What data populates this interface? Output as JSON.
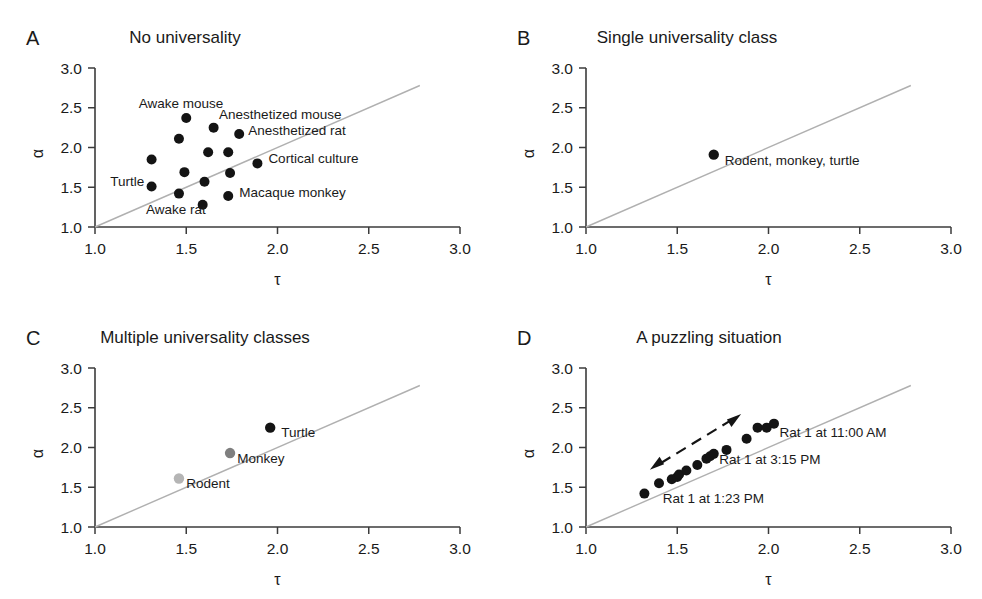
{
  "figure": {
    "axis_x_label": "τ",
    "axis_y_label": "α",
    "tick_labels": [
      "1.0",
      "1.5",
      "2.0",
      "2.5",
      "3.0"
    ],
    "tick_values": [
      1.0,
      1.5,
      2.0,
      2.5,
      3.0
    ],
    "axis_color": "#3b3b3b",
    "diagonal_color": "#b0b0b0",
    "point_color": "#141414"
  },
  "chart_data": [
    {
      "type": "scatter",
      "panel": "A",
      "title": "No universality",
      "xlabel": "τ",
      "ylabel": "α",
      "xlim": [
        1.0,
        3.0
      ],
      "ylim": [
        1.0,
        3.0
      ],
      "grid": false,
      "legend": "none",
      "identity_line": true,
      "points": [
        {
          "x": 1.5,
          "y": 2.37,
          "color": "#141414"
        },
        {
          "x": 1.65,
          "y": 2.25,
          "color": "#141414"
        },
        {
          "x": 1.46,
          "y": 2.11,
          "color": "#141414"
        },
        {
          "x": 1.79,
          "y": 2.17,
          "color": "#141414"
        },
        {
          "x": 1.31,
          "y": 1.85,
          "color": "#141414"
        },
        {
          "x": 1.62,
          "y": 1.94,
          "color": "#141414"
        },
        {
          "x": 1.73,
          "y": 1.94,
          "color": "#141414"
        },
        {
          "x": 1.89,
          "y": 1.8,
          "color": "#141414"
        },
        {
          "x": 1.49,
          "y": 1.69,
          "color": "#141414"
        },
        {
          "x": 1.74,
          "y": 1.68,
          "color": "#141414"
        },
        {
          "x": 1.31,
          "y": 1.51,
          "color": "#141414"
        },
        {
          "x": 1.6,
          "y": 1.57,
          "color": "#141414"
        },
        {
          "x": 1.46,
          "y": 1.42,
          "color": "#141414"
        },
        {
          "x": 1.73,
          "y": 1.39,
          "color": "#141414"
        },
        {
          "x": 1.59,
          "y": 1.28,
          "color": "#141414"
        }
      ],
      "annotations": [
        {
          "text": "Awake mouse",
          "x": 1.24,
          "y": 2.5,
          "anchor": "start"
        },
        {
          "text": "Anesthetized mouse",
          "x": 1.68,
          "y": 2.36,
          "anchor": "start"
        },
        {
          "text": "Anesthetized rat",
          "x": 1.84,
          "y": 2.16,
          "anchor": "start"
        },
        {
          "text": "Cortical culture",
          "x": 1.95,
          "y": 1.81,
          "anchor": "start"
        },
        {
          "text": "Turtle",
          "x": 1.27,
          "y": 1.51,
          "anchor": "end"
        },
        {
          "text": "Macaque monkey",
          "x": 1.79,
          "y": 1.38,
          "anchor": "start"
        },
        {
          "text": "Awake rat",
          "x": 1.28,
          "y": 1.16,
          "anchor": "start"
        }
      ]
    },
    {
      "type": "scatter",
      "panel": "B",
      "title": "Single universality class",
      "xlabel": "τ",
      "ylabel": "α",
      "xlim": [
        1.0,
        3.0
      ],
      "ylim": [
        1.0,
        3.0
      ],
      "grid": false,
      "legend": "none",
      "identity_line": true,
      "points": [
        {
          "x": 1.7,
          "y": 1.91,
          "color": "#141414"
        }
      ],
      "annotations": [
        {
          "text": "Rodent, monkey, turtle",
          "x": 1.76,
          "y": 1.78,
          "anchor": "start"
        }
      ]
    },
    {
      "type": "scatter",
      "panel": "C",
      "title": "Multiple universality classes",
      "xlabel": "τ",
      "ylabel": "α",
      "xlim": [
        1.0,
        3.0
      ],
      "ylim": [
        1.0,
        3.0
      ],
      "grid": false,
      "legend": "none",
      "identity_line": true,
      "points": [
        {
          "x": 1.46,
          "y": 1.61,
          "color": "#b5b5b5",
          "label": "Rodent"
        },
        {
          "x": 1.74,
          "y": 1.93,
          "color": "#7f7f7f",
          "label": "Monkey"
        },
        {
          "x": 1.96,
          "y": 2.25,
          "color": "#141414",
          "label": "Turtle"
        }
      ],
      "annotations": [
        {
          "text": "Turtle",
          "x": 2.02,
          "y": 2.13,
          "anchor": "start"
        },
        {
          "text": "Monkey",
          "x": 1.78,
          "y": 1.81,
          "anchor": "start"
        },
        {
          "text": "Rodent",
          "x": 1.5,
          "y": 1.49,
          "anchor": "start"
        }
      ]
    },
    {
      "type": "scatter",
      "panel": "D",
      "title": "A puzzling situation",
      "xlabel": "τ",
      "ylabel": "α",
      "xlim": [
        1.0,
        3.0
      ],
      "ylim": [
        1.0,
        3.0
      ],
      "grid": false,
      "legend": "none",
      "identity_line": true,
      "points": [
        {
          "x": 1.32,
          "y": 1.42,
          "color": "#141414"
        },
        {
          "x": 1.4,
          "y": 1.55,
          "color": "#141414"
        },
        {
          "x": 1.47,
          "y": 1.6,
          "color": "#141414"
        },
        {
          "x": 1.5,
          "y": 1.63,
          "color": "#141414"
        },
        {
          "x": 1.51,
          "y": 1.66,
          "color": "#141414"
        },
        {
          "x": 1.55,
          "y": 1.71,
          "color": "#141414"
        },
        {
          "x": 1.61,
          "y": 1.78,
          "color": "#141414"
        },
        {
          "x": 1.66,
          "y": 1.86,
          "color": "#141414"
        },
        {
          "x": 1.68,
          "y": 1.89,
          "color": "#141414"
        },
        {
          "x": 1.7,
          "y": 1.92,
          "color": "#141414"
        },
        {
          "x": 1.77,
          "y": 1.97,
          "color": "#141414"
        },
        {
          "x": 1.88,
          "y": 2.11,
          "color": "#141414"
        },
        {
          "x": 1.94,
          "y": 2.25,
          "color": "#141414"
        },
        {
          "x": 1.99,
          "y": 2.25,
          "color": "#141414"
        },
        {
          "x": 2.03,
          "y": 2.3,
          "color": "#141414"
        }
      ],
      "annotations": [
        {
          "text": "Rat 1 at 11:00 AM",
          "x": 2.06,
          "y": 2.13,
          "anchor": "start"
        },
        {
          "text": "Rat 1 at 3:15 PM",
          "x": 1.73,
          "y": 1.79,
          "anchor": "start"
        },
        {
          "text": "Rat 1 at 1:23 PM",
          "x": 1.42,
          "y": 1.3,
          "anchor": "start"
        }
      ],
      "arrow": {
        "from": {
          "x": 1.35,
          "y": 1.72
        },
        "to": {
          "x": 1.85,
          "y": 2.42
        },
        "double_headed": true,
        "style": "dashed"
      }
    }
  ],
  "panels": [
    {
      "letter": "A",
      "title": "No universality"
    },
    {
      "letter": "B",
      "title": "Single universality class"
    },
    {
      "letter": "C",
      "title": "Multiple universality classes"
    },
    {
      "letter": "D",
      "title": "A puzzling situation"
    }
  ]
}
